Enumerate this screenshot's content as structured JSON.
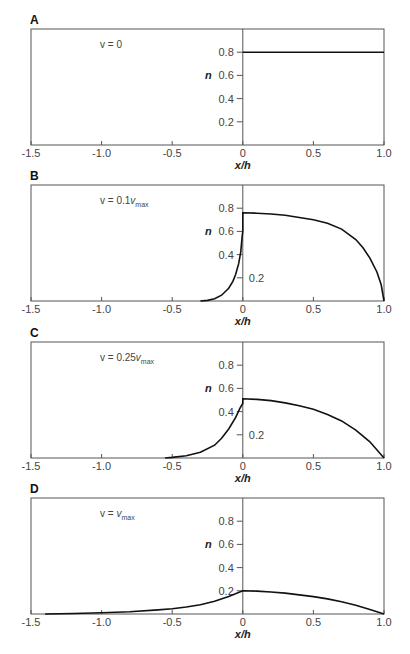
{
  "chart_data": [
    {
      "type": "line",
      "panel": "A",
      "annotation": {
        "prefix": "v = ",
        "main": "0",
        "sub": ""
      },
      "xlabel": "x/h",
      "ylabel": "n",
      "xlim": [
        -1.5,
        1.0
      ],
      "ylim": [
        0,
        1.0
      ],
      "xticks": [
        -1.5,
        -1.0,
        -0.5,
        0,
        0.5,
        1.0
      ],
      "xtick_labels": [
        "-1.5",
        "-1.0",
        "-0.5",
        "0",
        "0.5",
        "1.0"
      ],
      "yticks": [
        0.2,
        0.4,
        0.6,
        0.8
      ],
      "ytick_labels": [
        "0.2",
        "0.4",
        "0.6",
        "0.8"
      ],
      "ytick_label_right": [],
      "series": [
        {
          "name": "n",
          "x": [
            0,
            0.25,
            0.5,
            0.75,
            1.0
          ],
          "y": [
            0.8,
            0.8,
            0.8,
            0.8,
            0.8
          ]
        }
      ]
    },
    {
      "type": "line",
      "panel": "B",
      "annotation": {
        "prefix": "v = 0.1",
        "main": "v",
        "sub": "max"
      },
      "xlabel": "x/h",
      "ylabel": "n",
      "xlim": [
        -1.5,
        1.0
      ],
      "ylim": [
        0,
        1.0
      ],
      "xticks": [
        -1.5,
        -1.0,
        -0.5,
        0,
        0.5,
        1.0
      ],
      "xtick_labels": [
        "-1.5",
        "-1.0",
        "-0.5",
        "0",
        "0.5",
        "1.0"
      ],
      "yticks": [
        0.2,
        0.4,
        0.6,
        0.8
      ],
      "ytick_labels": [
        "0.2",
        "0.4",
        "0.6",
        "0.8"
      ],
      "ytick_label_right": [
        0.2
      ],
      "series": [
        {
          "name": "n",
          "x": [
            -0.3,
            -0.25,
            -0.2,
            -0.15,
            -0.1,
            -0.07,
            -0.05,
            -0.03,
            -0.015,
            -0.005,
            0,
            0,
            0.1,
            0.2,
            0.3,
            0.4,
            0.5,
            0.6,
            0.7,
            0.8,
            0.85,
            0.9,
            0.95,
            0.98,
            1.0
          ],
          "y": [
            0.0,
            0.005,
            0.02,
            0.05,
            0.11,
            0.17,
            0.23,
            0.32,
            0.42,
            0.55,
            0.6,
            0.76,
            0.757,
            0.75,
            0.74,
            0.72,
            0.7,
            0.67,
            0.62,
            0.53,
            0.46,
            0.37,
            0.25,
            0.14,
            0.0
          ]
        }
      ]
    },
    {
      "type": "line",
      "panel": "C",
      "annotation": {
        "prefix": "v = 0.25",
        "main": "v",
        "sub": "max"
      },
      "xlabel": "x/h",
      "ylabel": "n",
      "xlim": [
        -1.5,
        1.0
      ],
      "ylim": [
        0,
        1.0
      ],
      "xticks": [
        -1.5,
        -1.0,
        -0.5,
        0,
        0.5,
        1.0
      ],
      "xtick_labels": [
        "-1.5",
        "-1.0",
        "-0.5",
        "0",
        "0.5",
        "1.0"
      ],
      "yticks": [
        0.2,
        0.4,
        0.6,
        0.8
      ],
      "ytick_labels": [
        "0.2",
        "0.4",
        "0.6",
        "0.8"
      ],
      "ytick_label_right": [
        0.2
      ],
      "series": [
        {
          "name": "n",
          "x": [
            -0.55,
            -0.5,
            -0.4,
            -0.3,
            -0.2,
            -0.15,
            -0.1,
            -0.05,
            -0.02,
            0,
            0,
            0.1,
            0.2,
            0.3,
            0.4,
            0.5,
            0.6,
            0.7,
            0.8,
            0.9,
            1.0
          ],
          "y": [
            0.0,
            0.005,
            0.02,
            0.05,
            0.11,
            0.17,
            0.25,
            0.35,
            0.43,
            0.47,
            0.51,
            0.505,
            0.495,
            0.475,
            0.45,
            0.42,
            0.375,
            0.32,
            0.24,
            0.14,
            0.0
          ]
        }
      ]
    },
    {
      "type": "line",
      "panel": "D",
      "annotation": {
        "prefix": "v = ",
        "main": "v",
        "sub": "max"
      },
      "xlabel": "x/h",
      "ylabel": "n",
      "xlim": [
        -1.5,
        1.0
      ],
      "ylim": [
        0,
        1.0
      ],
      "xticks": [
        -1.5,
        -1.0,
        -0.5,
        0,
        0.5,
        1.0
      ],
      "xtick_labels": [
        "-1.5",
        "-1.0",
        "-0.5",
        "0",
        "0.5",
        "1.0"
      ],
      "yticks": [
        0.2,
        0.4,
        0.6,
        0.8
      ],
      "ytick_labels": [
        "0.2",
        "0.4",
        "0.6",
        "0.8"
      ],
      "ytick_label_right": [],
      "series": [
        {
          "name": "n",
          "x": [
            -1.4,
            -1.2,
            -1.0,
            -0.8,
            -0.6,
            -0.5,
            -0.4,
            -0.3,
            -0.2,
            -0.1,
            0,
            0.1,
            0.2,
            0.3,
            0.4,
            0.5,
            0.6,
            0.7,
            0.8,
            0.9,
            1.0
          ],
          "y": [
            0.0,
            0.004,
            0.01,
            0.02,
            0.035,
            0.045,
            0.06,
            0.08,
            0.11,
            0.15,
            0.2,
            0.197,
            0.19,
            0.18,
            0.165,
            0.15,
            0.13,
            0.105,
            0.075,
            0.04,
            0.0
          ]
        }
      ]
    }
  ]
}
